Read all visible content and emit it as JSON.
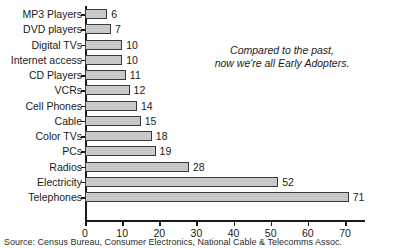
{
  "chart_data": {
    "type": "bar",
    "orientation": "horizontal",
    "title": "",
    "xlabel": "",
    "ylabel": "",
    "xlim": [
      0,
      70
    ],
    "grid": false,
    "legend": null,
    "categories": [
      "MP3 Players",
      "DVD players",
      "Digital TVs",
      "Internet access",
      "CD Players",
      "VCRs",
      "Cell Phones",
      "Cable",
      "Color TVs",
      "PCs",
      "Radios",
      "Electricity",
      "Telephones"
    ],
    "values": [
      6,
      7,
      10,
      10,
      11,
      12,
      14,
      15,
      18,
      19,
      28,
      52,
      71
    ],
    "data_labels": [
      "6",
      "7",
      "10",
      "10",
      "11",
      "12",
      "14",
      "15",
      "18",
      "19",
      "28",
      "52",
      "71"
    ],
    "xticks": [
      0,
      10,
      20,
      30,
      40,
      50,
      60,
      70
    ],
    "xtick_labels": [
      "0",
      "10",
      "20",
      "30",
      "40",
      "50",
      "60",
      "70"
    ],
    "annotations": [
      {
        "name": "early-adopters-note",
        "lines": [
          "Compared to the past,",
          "now we're all Early Adopters."
        ]
      }
    ],
    "source": "Source: Census Bureau, Consumer Electronics, National Cable & Telecomms Assoc.",
    "colors": {
      "bar_fill": "#c9c9c9",
      "bar_border": "#3a3a3a",
      "axis": "#1a1a1a",
      "text": "#1a1a1a",
      "background": "#ffffff"
    }
  }
}
